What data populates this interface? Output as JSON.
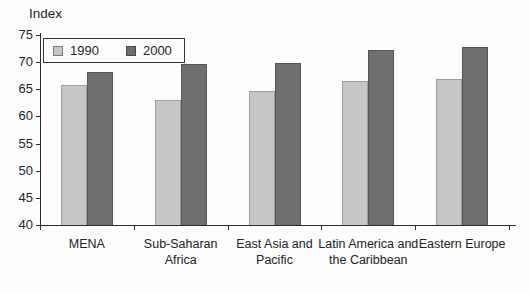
{
  "chart_data": {
    "type": "bar",
    "title": "",
    "ylabel": "Index",
    "xlabel": "",
    "categories": [
      "MENA",
      "Sub-Saharan Africa",
      "East Asia and Pacific",
      "Latin America and the Caribbean",
      "Eastern Europe"
    ],
    "series": [
      {
        "name": "1990",
        "color": "#c5c6c6",
        "border_color": "#9e9e9e",
        "values": [
          65.7,
          63.0,
          64.6,
          66.6,
          66.9
        ]
      },
      {
        "name": "2000",
        "color": "#6f6f6f",
        "border_color": "#555555",
        "values": [
          68.2,
          69.6,
          69.8,
          72.3,
          72.8
        ]
      }
    ],
    "ylim": [
      40,
      75
    ],
    "yticks": [
      40,
      45,
      50,
      55,
      60,
      65,
      70,
      75
    ],
    "grid": false,
    "legend_position": "top-left",
    "axis_color": "#2e2e2e"
  }
}
